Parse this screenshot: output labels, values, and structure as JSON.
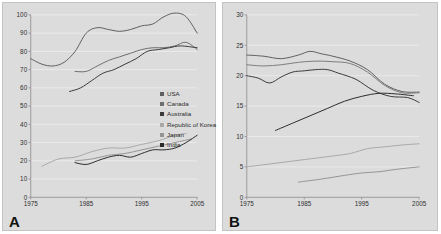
{
  "figure": {
    "background_color": "#dcdcdc",
    "border_color": "#c3c3c3",
    "gridline_color": "#f0f0f0",
    "axis_color": "#8a8a8a"
  },
  "panels": [
    {
      "letter": "A",
      "legend": [
        {
          "label": "USA",
          "color": "#5e5e5e"
        },
        {
          "label": "Canada",
          "color": "#6e6e6e"
        },
        {
          "label": "Australia",
          "color": "#3a3a3a"
        },
        {
          "label": "Republic of Korea",
          "color": "#a8a8a8"
        },
        {
          "label": "Japan",
          "color": "#949494"
        },
        {
          "label": "India",
          "color": "#2b2b2b"
        }
      ],
      "chart_data": {
        "type": "line",
        "title": "",
        "xlabel": "",
        "ylabel": "",
        "xlim": [
          1975,
          2005
        ],
        "ylim": [
          0,
          100
        ],
        "xticks": [
          1975,
          1985,
          1995,
          2005
        ],
        "yticks": [
          0,
          10,
          20,
          30,
          40,
          50,
          60,
          70,
          80,
          90,
          100
        ],
        "grid": true,
        "legend_position": "right-inside",
        "series": [
          {
            "name": "USA",
            "color": "#5e5e5e",
            "x": [
              1975,
              1977,
              1979,
              1981,
              1983,
              1985,
              1987,
              1989,
              1991,
              1993,
              1995,
              1997,
              1999,
              2001,
              2003,
              2005
            ],
            "y": [
              76,
              73,
              72,
              74,
              80,
              90,
              93,
              92,
              91,
              92,
              94,
              95,
              99,
              101,
              99,
              90
            ]
          },
          {
            "name": "Canada",
            "color": "#6e6e6e",
            "x": [
              1983,
              1985,
              1987,
              1989,
              1991,
              1993,
              1995,
              1997,
              1999,
              2001,
              2003,
              2005
            ],
            "y": [
              69,
              69,
              72,
              75,
              77,
              79,
              81,
              82,
              82,
              83,
              85,
              81
            ]
          },
          {
            "name": "Australia",
            "color": "#3a3a3a",
            "x": [
              1982,
              1984,
              1986,
              1988,
              1990,
              1992,
              1994,
              1996,
              1998,
              2000,
              2002,
              2005
            ],
            "y": [
              58,
              60,
              64,
              68,
              70,
              73,
              76,
              80,
              81,
              82,
              83,
              82
            ]
          },
          {
            "name": "Republic of Korea",
            "color": "#a8a8a8",
            "x": [
              1977,
              1980,
              1983,
              1986,
              1989,
              1992,
              1995,
              1998,
              2001,
              2003
            ],
            "y": [
              17,
              21,
              22,
              25,
              27,
              27,
              29,
              31,
              34,
              35
            ]
          },
          {
            "name": "Japan",
            "color": "#949494",
            "x": [
              1983,
              1986,
              1989,
              1992,
              1995,
              1998,
              2001,
              2004
            ],
            "y": [
              20,
              21,
              23,
              24,
              26,
              28,
              30,
              32
            ]
          },
          {
            "name": "India",
            "color": "#2b2b2b",
            "x": [
              1983,
              1985,
              1987,
              1989,
              1991,
              1993,
              1995,
              1997,
              1999,
              2001,
              2003,
              2005
            ],
            "y": [
              19,
              18,
              20,
              22,
              23,
              22,
              24,
              26,
              26,
              27,
              30,
              34
            ]
          }
        ]
      }
    },
    {
      "letter": "B",
      "legend": [
        {
          "label": "USA",
          "color": "#5e5e5e"
        },
        {
          "label": "Canada",
          "color": "#7b7b7b"
        },
        {
          "label": "Australia",
          "color": "#3a3a3a"
        },
        {
          "label": "Republic of Korea",
          "color": "#a8a8a8"
        },
        {
          "label": "Japan",
          "color": "#949494"
        },
        {
          "label": "Russian Federation",
          "color": "#2b2b2b"
        }
      ],
      "chart_data": {
        "type": "line",
        "title": "",
        "xlabel": "",
        "ylabel": "",
        "xlim": [
          1975,
          2005
        ],
        "ylim": [
          0,
          30
        ],
        "xticks": [
          1975,
          1985,
          1995,
          2005
        ],
        "yticks": [
          0,
          5,
          10,
          15,
          20,
          25,
          30
        ],
        "grid": true,
        "legend_position": "right-inside",
        "series": [
          {
            "name": "USA",
            "color": "#5e5e5e",
            "x": [
              1975,
              1978,
              1981,
              1984,
              1986,
              1988,
              1990,
              1993,
              1996,
              1999,
              2002,
              2005
            ],
            "y": [
              23.4,
              23.2,
              22.8,
              23.4,
              24.0,
              23.6,
              23.2,
              22.4,
              21.0,
              18.6,
              17.4,
              17.3
            ]
          },
          {
            "name": "Canada",
            "color": "#7b7b7b",
            "x": [
              1975,
              1978,
              1981,
              1984,
              1987,
              1990,
              1993,
              1996,
              1999,
              2002,
              2005
            ],
            "y": [
              21.8,
              21.6,
              21.8,
              22.2,
              22.4,
              22.3,
              22.0,
              20.6,
              18.4,
              17.2,
              17.2
            ]
          },
          {
            "name": "Australia",
            "color": "#3a3a3a",
            "x": [
              1975,
              1977,
              1979,
              1981,
              1983,
              1985,
              1987,
              1989,
              1991,
              1994,
              1997,
              2000,
              2003,
              2005
            ],
            "y": [
              20.0,
              19.6,
              18.8,
              19.8,
              20.6,
              20.8,
              21.0,
              21.0,
              20.4,
              19.4,
              17.6,
              16.6,
              16.4,
              15.6
            ]
          },
          {
            "name": "Republic of Korea",
            "color": "#a8a8a8",
            "x": [
              1975,
              1980,
              1985,
              1990,
              1993,
              1996,
              1999,
              2002,
              2005
            ],
            "y": [
              5.0,
              5.6,
              6.2,
              6.8,
              7.2,
              8.0,
              8.3,
              8.6,
              8.8
            ]
          },
          {
            "name": "Japan",
            "color": "#949494",
            "x": [
              1984,
              1988,
              1992,
              1995,
              1998,
              2001,
              2005
            ],
            "y": [
              2.5,
              3.0,
              3.6,
              4.0,
              4.2,
              4.6,
              5.0
            ]
          },
          {
            "name": "Russian Federation",
            "color": "#2b2b2b",
            "x": [
              1980,
              1983,
              1986,
              1989,
              1992,
              1995,
              1998,
              2001,
              2004
            ],
            "y": [
              11.0,
              12.2,
              13.4,
              14.6,
              15.8,
              16.6,
              17.1,
              17.0,
              16.7
            ]
          }
        ]
      }
    }
  ]
}
